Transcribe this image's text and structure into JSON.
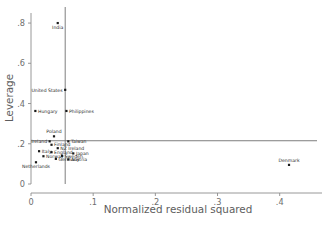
{
  "chart_data": {
    "type": "scatter",
    "title": "",
    "xlabel": "Normalized residual squared",
    "ylabel": "Leverage",
    "xlim": [
      -0.02,
      0.46
    ],
    "ylim": [
      -0.02,
      0.85
    ],
    "xticks": [
      "0",
      ".1",
      ".2",
      ".3",
      ".4"
    ],
    "xtick_values": [
      0,
      0.1,
      0.2,
      0.3,
      0.4
    ],
    "yticks": [
      "0",
      ".2",
      ".4",
      ".6",
      ".8"
    ],
    "ytick_values": [
      0,
      0.2,
      0.4,
      0.6,
      0.8
    ],
    "grid": false,
    "legend": "none",
    "reference_lines": [
      {
        "name": "mean-normalized-residual-squared",
        "orientation": "vertical",
        "value": 0.055
      },
      {
        "name": "mean-leverage",
        "orientation": "horizontal",
        "value": 0.215
      }
    ],
    "points": [
      {
        "label": "India",
        "x": 0.043,
        "y": 0.8,
        "label_pos": "below"
      },
      {
        "label": "United States",
        "x": 0.055,
        "y": 0.468,
        "label_pos": "left"
      },
      {
        "label": "Hungary",
        "x": 0.007,
        "y": 0.363,
        "label_pos": "right"
      },
      {
        "label": "Philippines",
        "x": 0.057,
        "y": 0.363,
        "label_pos": "right"
      },
      {
        "label": "Poland",
        "x": 0.037,
        "y": 0.237,
        "label_pos": "above"
      },
      {
        "label": "Ireland",
        "x": 0.03,
        "y": 0.212,
        "label_pos": "left"
      },
      {
        "label": "Taiwan",
        "x": 0.06,
        "y": 0.212,
        "label_pos": "right"
      },
      {
        "label": "Finland",
        "x": 0.033,
        "y": 0.195,
        "label_pos": "right"
      },
      {
        "label": "NZ Ireland",
        "x": 0.043,
        "y": 0.178,
        "label_pos": "right"
      },
      {
        "label": "Italy",
        "x": 0.013,
        "y": 0.163,
        "label_pos": "right"
      },
      {
        "label": "England",
        "x": 0.033,
        "y": 0.158,
        "label_pos": "right"
      },
      {
        "label": "Japan",
        "x": 0.068,
        "y": 0.152,
        "label_pos": "right"
      },
      {
        "label": "Norway",
        "x": 0.02,
        "y": 0.138,
        "label_pos": "right"
      },
      {
        "label": "Sweden",
        "x": 0.05,
        "y": 0.14,
        "label_pos": "right"
      },
      {
        "label": "Germany",
        "x": 0.04,
        "y": 0.125,
        "label_pos": "right"
      },
      {
        "label": "Austria",
        "x": 0.06,
        "y": 0.122,
        "label_pos": "right"
      },
      {
        "label": "Netherlands",
        "x": 0.008,
        "y": 0.108,
        "label_pos": "below"
      },
      {
        "label": "Denmark",
        "x": 0.415,
        "y": 0.095,
        "label_pos": "above"
      }
    ]
  },
  "colors": {
    "point": "#1a1a1a",
    "axis": "#8c8c8c",
    "refline": "#6f6f6f",
    "ticklabel": "#6e6e6e",
    "axistitle": "#5d5d5d",
    "background": "#ffffff"
  }
}
